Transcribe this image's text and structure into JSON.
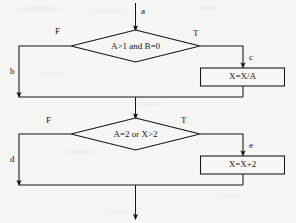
{
  "diagram": {
    "type": "flowchart",
    "stroke_color": "#15151a",
    "background_color": "#f7f6f4",
    "entry": {
      "label": "a"
    },
    "decisions": [
      {
        "id": "decision-1",
        "condition": "A>1  and  B=0",
        "false_label": "F",
        "true_label": "T",
        "false_edge_label": "b",
        "true_edge_label": "c"
      },
      {
        "id": "decision-2",
        "condition": "A=2   or   X>2",
        "false_label": "F",
        "true_label": "T",
        "false_edge_label": "d",
        "true_edge_label": "e"
      }
    ],
    "processes": [
      {
        "id": "process-1",
        "statement": "X=X/A"
      },
      {
        "id": "process-2",
        "statement": "X=X+2"
      }
    ]
  }
}
